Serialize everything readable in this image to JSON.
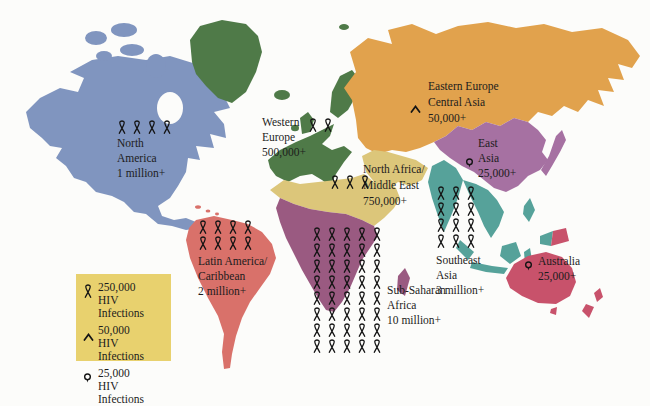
{
  "colors": {
    "background": "#fcfcfa",
    "text": "#1c1c1c",
    "legend_background": "#e8d16e",
    "icon_ink": "#141414"
  },
  "legend": {
    "items": [
      {
        "icon": {
          "type": "ribbon",
          "count": 1,
          "cols": 1
        },
        "count_label": "250,000",
        "label": "HIV Infections"
      },
      {
        "icon": {
          "type": "caret",
          "count": 1,
          "cols": 1
        },
        "count_label": "50,000",
        "label": "HIV Infections"
      },
      {
        "icon": {
          "type": "pin",
          "count": 1,
          "cols": 1
        },
        "count_label": "25,000",
        "label": "HIV Infections"
      }
    ]
  },
  "regions": [
    {
      "id": "north-america",
      "lines": [
        "North",
        "America",
        "1 million+"
      ],
      "value": "1 million+",
      "color": "#8095bf",
      "icons": {
        "type": "ribbon",
        "count": 4,
        "cols": 4
      }
    },
    {
      "id": "western-europe",
      "lines": [
        "Western",
        "Europe",
        "500,000+"
      ],
      "value": "500,000+",
      "color": "#4f7a48",
      "icons": {
        "type": "ribbon",
        "count": 2,
        "cols": 2
      }
    },
    {
      "id": "eastern-europe-central-asia",
      "lines": [
        "Eastern Europe",
        "Central Asia",
        "50,000+"
      ],
      "value": "50,000+",
      "color": "#e1a24d",
      "icons": {
        "type": "caret",
        "count": 1,
        "cols": 1
      }
    },
    {
      "id": "north-africa-middle-east",
      "lines": [
        "North Africa/",
        "Middle East",
        "750,000+"
      ],
      "value": "750,000+",
      "color": "#dcc67a",
      "icons": {
        "type": "ribbon",
        "count": 3,
        "cols": 3
      }
    },
    {
      "id": "east-asia",
      "lines": [
        "East",
        "Asia",
        "25,000+"
      ],
      "value": "25,000+",
      "color": "#a671a2",
      "icons": {
        "type": "pin",
        "count": 1,
        "cols": 1
      }
    },
    {
      "id": "latin-america-caribbean",
      "lines": [
        "Latin America/",
        "Caribbean",
        "2 million+"
      ],
      "value": "2 million+",
      "color": "#d9716a",
      "icons": {
        "type": "ribbon",
        "count": 8,
        "cols": 4
      }
    },
    {
      "id": "sub-saharan-africa",
      "lines": [
        "Sub-Saharan",
        "Africa",
        "10 million+"
      ],
      "value": "10 million+",
      "color": "#9a5a81",
      "icons": {
        "type": "ribbon",
        "count": 40,
        "cols": 5
      }
    },
    {
      "id": "southeast-asia",
      "lines": [
        "Southeast",
        "Asia",
        "3 million+"
      ],
      "value": "3 million+",
      "color": "#56a29a",
      "icons": {
        "type": "ribbon",
        "count": 12,
        "cols": 3
      }
    },
    {
      "id": "australia",
      "lines": [
        "Australia",
        "25,000+"
      ],
      "value": "25,000+",
      "color": "#c8526b",
      "icons": {
        "type": "pin",
        "count": 1,
        "cols": 1
      }
    }
  ]
}
